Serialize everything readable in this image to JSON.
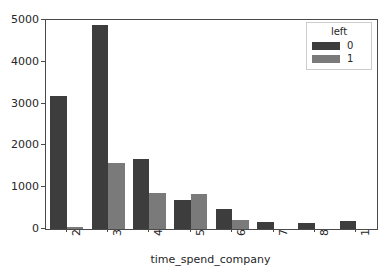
{
  "top_clipped_text": "",
  "chart_data": {
    "type": "bar",
    "title": "",
    "xlabel": "time_spend_company",
    "ylabel": "",
    "categories": [
      "2",
      "3",
      "4",
      "5",
      "6",
      "7",
      "8",
      "10"
    ],
    "series": [
      {
        "name": "0",
        "color": "#3d3d3d",
        "values": [
          3180,
          4880,
          1675,
          695,
          480,
          170,
          145,
          185
        ]
      },
      {
        "name": "1",
        "color": "#7a7a7a",
        "values": [
          50,
          1580,
          860,
          840,
          215,
          0,
          0,
          0
        ]
      }
    ],
    "legend": {
      "title": "left",
      "position": "upper right",
      "entries": [
        "0",
        "1"
      ]
    },
    "ylim": [
      0,
      5000
    ],
    "yticks": [
      "0",
      "1000",
      "2000",
      "3000",
      "4000",
      "5000"
    ],
    "ytick_values": [
      0,
      1000,
      2000,
      3000,
      4000,
      5000
    ],
    "grid": false,
    "xtick_rotation": -90
  }
}
